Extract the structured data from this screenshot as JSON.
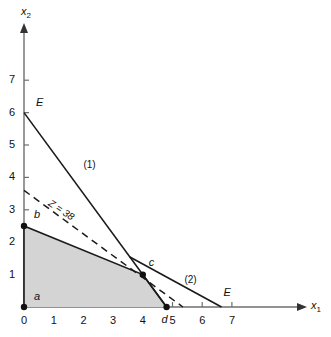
{
  "chart_data": {
    "type": "line",
    "title": "",
    "xlabel": "x1",
    "ylabel": "x2",
    "xlim": [
      0,
      7.6
    ],
    "ylim": [
      0,
      7.9
    ],
    "grid": false,
    "legend_position": "none",
    "x_ticks": [
      "0",
      "1",
      "2",
      "3",
      "4",
      "5",
      "6",
      "7"
    ],
    "x_tick_values": [
      0,
      1,
      2,
      3,
      4,
      5,
      6,
      7
    ],
    "y_ticks": [
      "1",
      "2",
      "3",
      "4",
      "5",
      "6",
      "7"
    ],
    "y_tick_values": [
      1,
      2,
      3,
      4,
      5,
      6,
      7
    ],
    "series": [
      {
        "name": "(1)",
        "style": "solid",
        "label": "(1)",
        "label_at": [
          2.0,
          4.55
        ],
        "points": [
          [
            0,
            6
          ],
          [
            4.8,
            0
          ]
        ]
      },
      {
        "name": "(2)",
        "style": "solid",
        "label": "(2)",
        "label_at": [
          5.4,
          1.0
        ],
        "points": [
          [
            3.55,
            1.55
          ],
          [
            6.65,
            0
          ]
        ]
      },
      {
        "name": "Z = 38",
        "style": "dashed",
        "label": "Z = 38",
        "label_at": [
          0.95,
          3.35
        ],
        "points": [
          [
            0,
            3.6
          ],
          [
            5.35,
            0
          ]
        ]
      }
    ],
    "region": {
      "name": "feasible-region",
      "fill": "#d4d4d4",
      "stroke": "#1a1a1a",
      "vertices": [
        [
          0,
          0
        ],
        [
          0,
          2.5
        ],
        [
          4,
          1
        ],
        [
          4.8,
          0
        ]
      ]
    },
    "vertex_points": [
      {
        "id": "a",
        "label": "a",
        "x": 0,
        "y": 0,
        "label_dx": 10,
        "label_dy": -16
      },
      {
        "id": "b",
        "label": "b",
        "x": 0,
        "y": 2.5,
        "label_dx": 10,
        "label_dy": -17
      },
      {
        "id": "c",
        "label": "c",
        "x": 4,
        "y": 1,
        "label_dx": 6,
        "label_dy": -18
      },
      {
        "id": "d",
        "label": "d",
        "x": 4.8,
        "y": 0,
        "label_dx": -5,
        "label_dy": 7
      }
    ],
    "endpoint_labels": [
      {
        "id": "E-upper",
        "label": "E",
        "x": 0,
        "y": 6,
        "label_dx": 12,
        "label_dy": -16
      },
      {
        "id": "E-right",
        "label": "E",
        "x": 6.65,
        "y": 0,
        "label_dx": 2,
        "label_dy": -20
      }
    ],
    "colors": {
      "axis": "#6e6e6e",
      "line": "#1a1a1a",
      "region_fill": "#d4d4d4",
      "text": "#111111"
    }
  }
}
